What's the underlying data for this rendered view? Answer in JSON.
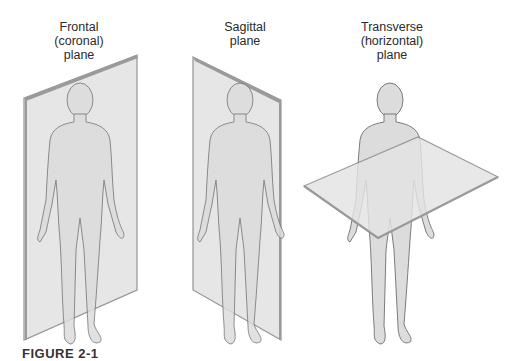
{
  "figure": {
    "caption": "FIGURE 2-1",
    "panels": [
      {
        "id": "frontal",
        "label_lines": [
          "Frontal",
          "(coronal)",
          "plane"
        ]
      },
      {
        "id": "sagittal",
        "label_lines": [
          "Sagittal",
          "plane"
        ]
      },
      {
        "id": "transverse",
        "label_lines": [
          "Transverse",
          "(horizontal)",
          "plane"
        ]
      }
    ]
  },
  "colors": {
    "plane_fill": "#e4e4e4",
    "plane_edge": "#8a8a8a",
    "body_fill": "#dcdcdc",
    "body_stroke": "#6e6e6e",
    "text": "#2a2a2a"
  }
}
